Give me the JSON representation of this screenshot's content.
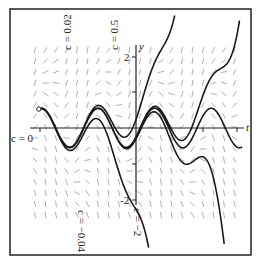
{
  "figure": {
    "type": "slope-field-with-solution-curves",
    "axes": {
      "x_label": "t",
      "y_label": "y",
      "y_tick_labels": [
        "2",
        "-2"
      ],
      "y_ticks": [
        2,
        1,
        -1,
        -2
      ]
    },
    "curve_labels": [
      {
        "text": "c = 0.02",
        "id": "c002"
      },
      {
        "text": "c = 0.5",
        "id": "c05"
      },
      {
        "text": "c = 0",
        "id": "c0"
      },
      {
        "text": "c = −0.04",
        "id": "cm004"
      },
      {
        "text": "c = −2",
        "id": "cm2"
      }
    ],
    "colors": {
      "frame": "#222222",
      "curve": "#1a1a1a",
      "slope": "#888888"
    }
  }
}
